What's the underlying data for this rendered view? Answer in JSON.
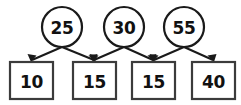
{
  "diagram": {
    "type": "tree-sum-diagram",
    "title": "",
    "colors": {
      "background": "#ffffff",
      "circle_stroke": "#1a1a1a",
      "box_stroke": "#3b3b3b",
      "arrow": "#1a1a1a",
      "text": "#111111"
    },
    "circles": [
      {
        "id": "circle-1",
        "label": "25",
        "cx": 62,
        "cy": 27,
        "r": 20
      },
      {
        "id": "circle-2",
        "label": "30",
        "cx": 124,
        "cy": 27,
        "r": 20
      },
      {
        "id": "circle-3",
        "label": "55",
        "cx": 184,
        "cy": 27,
        "r": 20
      }
    ],
    "boxes": [
      {
        "id": "box-1",
        "label": "10",
        "x": 10,
        "y": 62,
        "w": 43,
        "h": 37
      },
      {
        "id": "box-2",
        "label": "15",
        "x": 73,
        "y": 62,
        "w": 43,
        "h": 37
      },
      {
        "id": "box-3",
        "label": "15",
        "x": 132,
        "y": 62,
        "w": 43,
        "h": 37
      },
      {
        "id": "box-4",
        "label": "40",
        "x": 192,
        "y": 62,
        "w": 43,
        "h": 37
      }
    ],
    "edges": [
      {
        "id": "edge-1-left",
        "from": "circle-1",
        "to": "box-1"
      },
      {
        "id": "edge-1-right",
        "from": "circle-1",
        "to": "box-2"
      },
      {
        "id": "edge-2-left",
        "from": "circle-2",
        "to": "box-2"
      },
      {
        "id": "edge-2-right",
        "from": "circle-2",
        "to": "box-3"
      },
      {
        "id": "edge-3-left",
        "from": "circle-3",
        "to": "box-3"
      },
      {
        "id": "edge-3-right",
        "from": "circle-3",
        "to": "box-4"
      }
    ]
  }
}
